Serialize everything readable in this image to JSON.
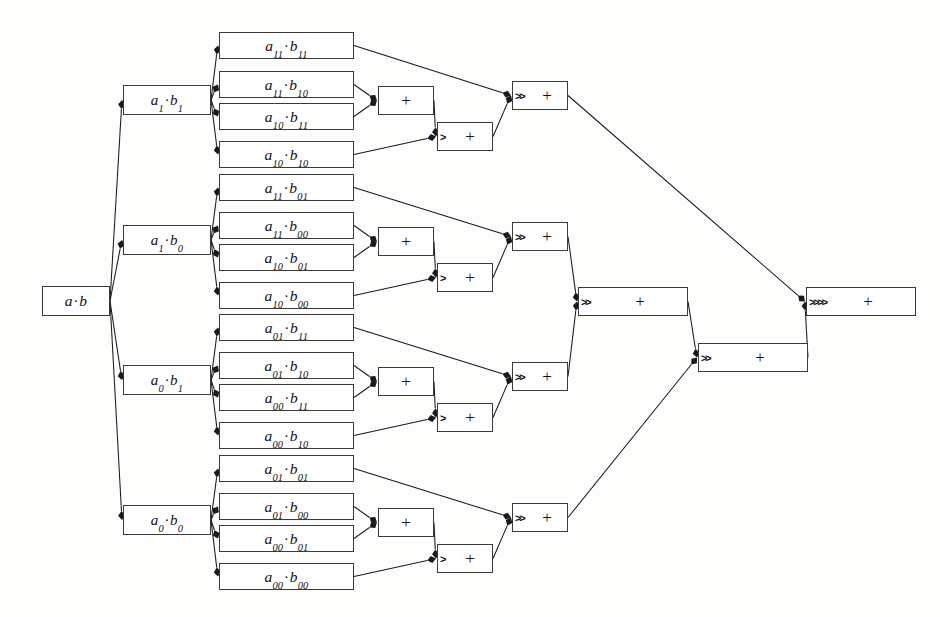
{
  "diagram": {
    "colors": {
      "background": "#fdfdfb",
      "node_fill": "#ffffff",
      "node_stroke": "#3a3a3a",
      "edge_stroke": "#1a1a1a",
      "text": "#111111"
    },
    "root": {
      "id": "root",
      "label": "a·b",
      "x": 42,
      "y": 286,
      "w": 68,
      "h": 30
    },
    "level2": [
      {
        "id": "a1b1",
        "label": "a₁·b₁",
        "x": 123,
        "y": 85,
        "w": 88,
        "h": 30
      },
      {
        "id": "a1b0",
        "label": "a₁·b₀",
        "x": 123,
        "y": 225,
        "w": 88,
        "h": 30
      },
      {
        "id": "a0b1",
        "label": "a₀·b₁",
        "x": 123,
        "y": 365,
        "w": 88,
        "h": 30
      },
      {
        "id": "a0b0",
        "label": "a₀·b₀",
        "x": 123,
        "y": 505,
        "w": 88,
        "h": 30
      }
    ],
    "groups": [
      {
        "id": "g1",
        "parent": "a1b1",
        "terms": [
          {
            "id": "t1",
            "label": "a₁₁·b₁₁",
            "x": 219,
            "y": 32,
            "w": 135,
            "h": 27
          },
          {
            "id": "t2",
            "label": "a₁₁·b₁₀",
            "x": 219,
            "y": 71,
            "w": 135,
            "h": 27
          },
          {
            "id": "t3",
            "label": "a₁₀·b₁₁",
            "x": 219,
            "y": 103,
            "w": 135,
            "h": 27
          },
          {
            "id": "t4",
            "label": "a₁₀·b₁₀",
            "x": 219,
            "y": 141,
            "w": 135,
            "h": 27
          },
          {
            "id": "add1",
            "type": "op",
            "shift": "",
            "plus": "+",
            "x": 378,
            "y": 86,
            "w": 56,
            "h": 29
          },
          {
            "id": "add2",
            "type": "op",
            "shift": ">",
            "plus": "+",
            "x": 437,
            "y": 122,
            "w": 56,
            "h": 29
          },
          {
            "id": "add3",
            "type": "op",
            "shift": ">>",
            "plus": "+",
            "x": 512,
            "y": 81,
            "w": 56,
            "h": 29
          }
        ]
      },
      {
        "id": "g2",
        "parent": "a1b0",
        "terms": [
          {
            "id": "t5",
            "label": "a₁₁·b₀₁",
            "x": 219,
            "y": 174,
            "w": 135,
            "h": 27
          },
          {
            "id": "t6",
            "label": "a₁₁·b₀₀",
            "x": 219,
            "y": 212,
            "w": 135,
            "h": 27
          },
          {
            "id": "t7",
            "label": "a₁₀·b₀₁",
            "x": 219,
            "y": 244,
            "w": 135,
            "h": 27
          },
          {
            "id": "t8",
            "label": "a₁₀·b₀₀",
            "x": 219,
            "y": 282,
            "w": 135,
            "h": 27
          },
          {
            "id": "add4",
            "type": "op",
            "shift": "",
            "plus": "+",
            "x": 378,
            "y": 227,
            "w": 56,
            "h": 29
          },
          {
            "id": "add5",
            "type": "op",
            "shift": ">",
            "plus": "+",
            "x": 437,
            "y": 263,
            "w": 56,
            "h": 29
          },
          {
            "id": "add6",
            "type": "op",
            "shift": ">>",
            "plus": "+",
            "x": 512,
            "y": 222,
            "w": 56,
            "h": 29
          }
        ]
      },
      {
        "id": "g3",
        "parent": "a0b1",
        "terms": [
          {
            "id": "t9",
            "label": "a₀₁·b₁₁",
            "x": 219,
            "y": 314,
            "w": 135,
            "h": 27
          },
          {
            "id": "t10",
            "label": "a₀₁·b₁₀",
            "x": 219,
            "y": 352,
            "w": 135,
            "h": 27
          },
          {
            "id": "t11",
            "label": "a₀₀·b₁₁",
            "x": 219,
            "y": 384,
            "w": 135,
            "h": 27
          },
          {
            "id": "t12",
            "label": "a₀₀·b₁₀",
            "x": 219,
            "y": 422,
            "w": 135,
            "h": 27
          },
          {
            "id": "add7",
            "type": "op",
            "shift": "",
            "plus": "+",
            "x": 378,
            "y": 367,
            "w": 56,
            "h": 29
          },
          {
            "id": "add8",
            "type": "op",
            "shift": ">",
            "plus": "+",
            "x": 437,
            "y": 403,
            "w": 56,
            "h": 29
          },
          {
            "id": "add9",
            "type": "op",
            "shift": ">>",
            "plus": "+",
            "x": 512,
            "y": 362,
            "w": 56,
            "h": 29
          }
        ]
      },
      {
        "id": "g4",
        "parent": "a0b0",
        "terms": [
          {
            "id": "t13",
            "label": "a₀₁·b₀₁",
            "x": 219,
            "y": 455,
            "w": 135,
            "h": 27
          },
          {
            "id": "t14",
            "label": "a₀₁·b₀₀",
            "x": 219,
            "y": 493,
            "w": 135,
            "h": 27
          },
          {
            "id": "t15",
            "label": "a₀₀·b₀₁",
            "x": 219,
            "y": 525,
            "w": 135,
            "h": 27
          },
          {
            "id": "t16",
            "label": "a₀₀·b₀₀",
            "x": 219,
            "y": 563,
            "w": 135,
            "h": 27
          },
          {
            "id": "add10",
            "type": "op",
            "shift": "",
            "plus": "+",
            "x": 378,
            "y": 508,
            "w": 56,
            "h": 29
          },
          {
            "id": "add11",
            "type": "op",
            "shift": ">",
            "plus": "+",
            "x": 437,
            "y": 544,
            "w": 56,
            "h": 29
          },
          {
            "id": "add12",
            "type": "op",
            "shift": ">>",
            "plus": "+",
            "x": 512,
            "y": 503,
            "w": 56,
            "h": 29
          }
        ]
      }
    ],
    "merges": [
      {
        "id": "m1",
        "type": "op",
        "shift": ">>",
        "plus": "+",
        "x": 578,
        "y": 287,
        "w": 110,
        "h": 29
      },
      {
        "id": "m2",
        "type": "op",
        "shift": ">>",
        "plus": "+",
        "x": 698,
        "y": 343,
        "w": 110,
        "h": 29
      },
      {
        "id": "m3",
        "type": "op",
        "shift": ">>>>",
        "plus": "+",
        "x": 806,
        "y": 287,
        "w": 110,
        "h": 29
      }
    ],
    "edges": [
      {
        "from": "root",
        "to": "a1b1"
      },
      {
        "from": "root",
        "to": "a1b0"
      },
      {
        "from": "root",
        "to": "a0b1"
      },
      {
        "from": "root",
        "to": "a0b0"
      },
      {
        "from": "a1b1",
        "to": "t1"
      },
      {
        "from": "a1b1",
        "to": "t2"
      },
      {
        "from": "a1b1",
        "to": "t3"
      },
      {
        "from": "a1b1",
        "to": "t4"
      },
      {
        "from": "a1b0",
        "to": "t5"
      },
      {
        "from": "a1b0",
        "to": "t6"
      },
      {
        "from": "a1b0",
        "to": "t7"
      },
      {
        "from": "a1b0",
        "to": "t8"
      },
      {
        "from": "a0b1",
        "to": "t9"
      },
      {
        "from": "a0b1",
        "to": "t10"
      },
      {
        "from": "a0b1",
        "to": "t11"
      },
      {
        "from": "a0b1",
        "to": "t12"
      },
      {
        "from": "a0b0",
        "to": "t13"
      },
      {
        "from": "a0b0",
        "to": "t14"
      },
      {
        "from": "a0b0",
        "to": "t15"
      },
      {
        "from": "a0b0",
        "to": "t16"
      },
      {
        "from": "t2",
        "to": "add1"
      },
      {
        "from": "t3",
        "to": "add1"
      },
      {
        "from": "add1",
        "to": "add2"
      },
      {
        "from": "t4",
        "to": "add2"
      },
      {
        "from": "t1",
        "to": "add3"
      },
      {
        "from": "add2",
        "to": "add3"
      },
      {
        "from": "t6",
        "to": "add4"
      },
      {
        "from": "t7",
        "to": "add4"
      },
      {
        "from": "add4",
        "to": "add5"
      },
      {
        "from": "t8",
        "to": "add5"
      },
      {
        "from": "t5",
        "to": "add6"
      },
      {
        "from": "add5",
        "to": "add6"
      },
      {
        "from": "t10",
        "to": "add7"
      },
      {
        "from": "t11",
        "to": "add7"
      },
      {
        "from": "add7",
        "to": "add8"
      },
      {
        "from": "t12",
        "to": "add8"
      },
      {
        "from": "t9",
        "to": "add9"
      },
      {
        "from": "add8",
        "to": "add9"
      },
      {
        "from": "t14",
        "to": "add10"
      },
      {
        "from": "t15",
        "to": "add10"
      },
      {
        "from": "add10",
        "to": "add11"
      },
      {
        "from": "t16",
        "to": "add11"
      },
      {
        "from": "t13",
        "to": "add12"
      },
      {
        "from": "add11",
        "to": "add12"
      },
      {
        "from": "add6",
        "to": "m1"
      },
      {
        "from": "add9",
        "to": "m1"
      },
      {
        "from": "m1",
        "to": "m2"
      },
      {
        "from": "add12",
        "to": "m2"
      },
      {
        "from": "add3",
        "to": "m3"
      },
      {
        "from": "m2",
        "to": "m3"
      }
    ]
  }
}
